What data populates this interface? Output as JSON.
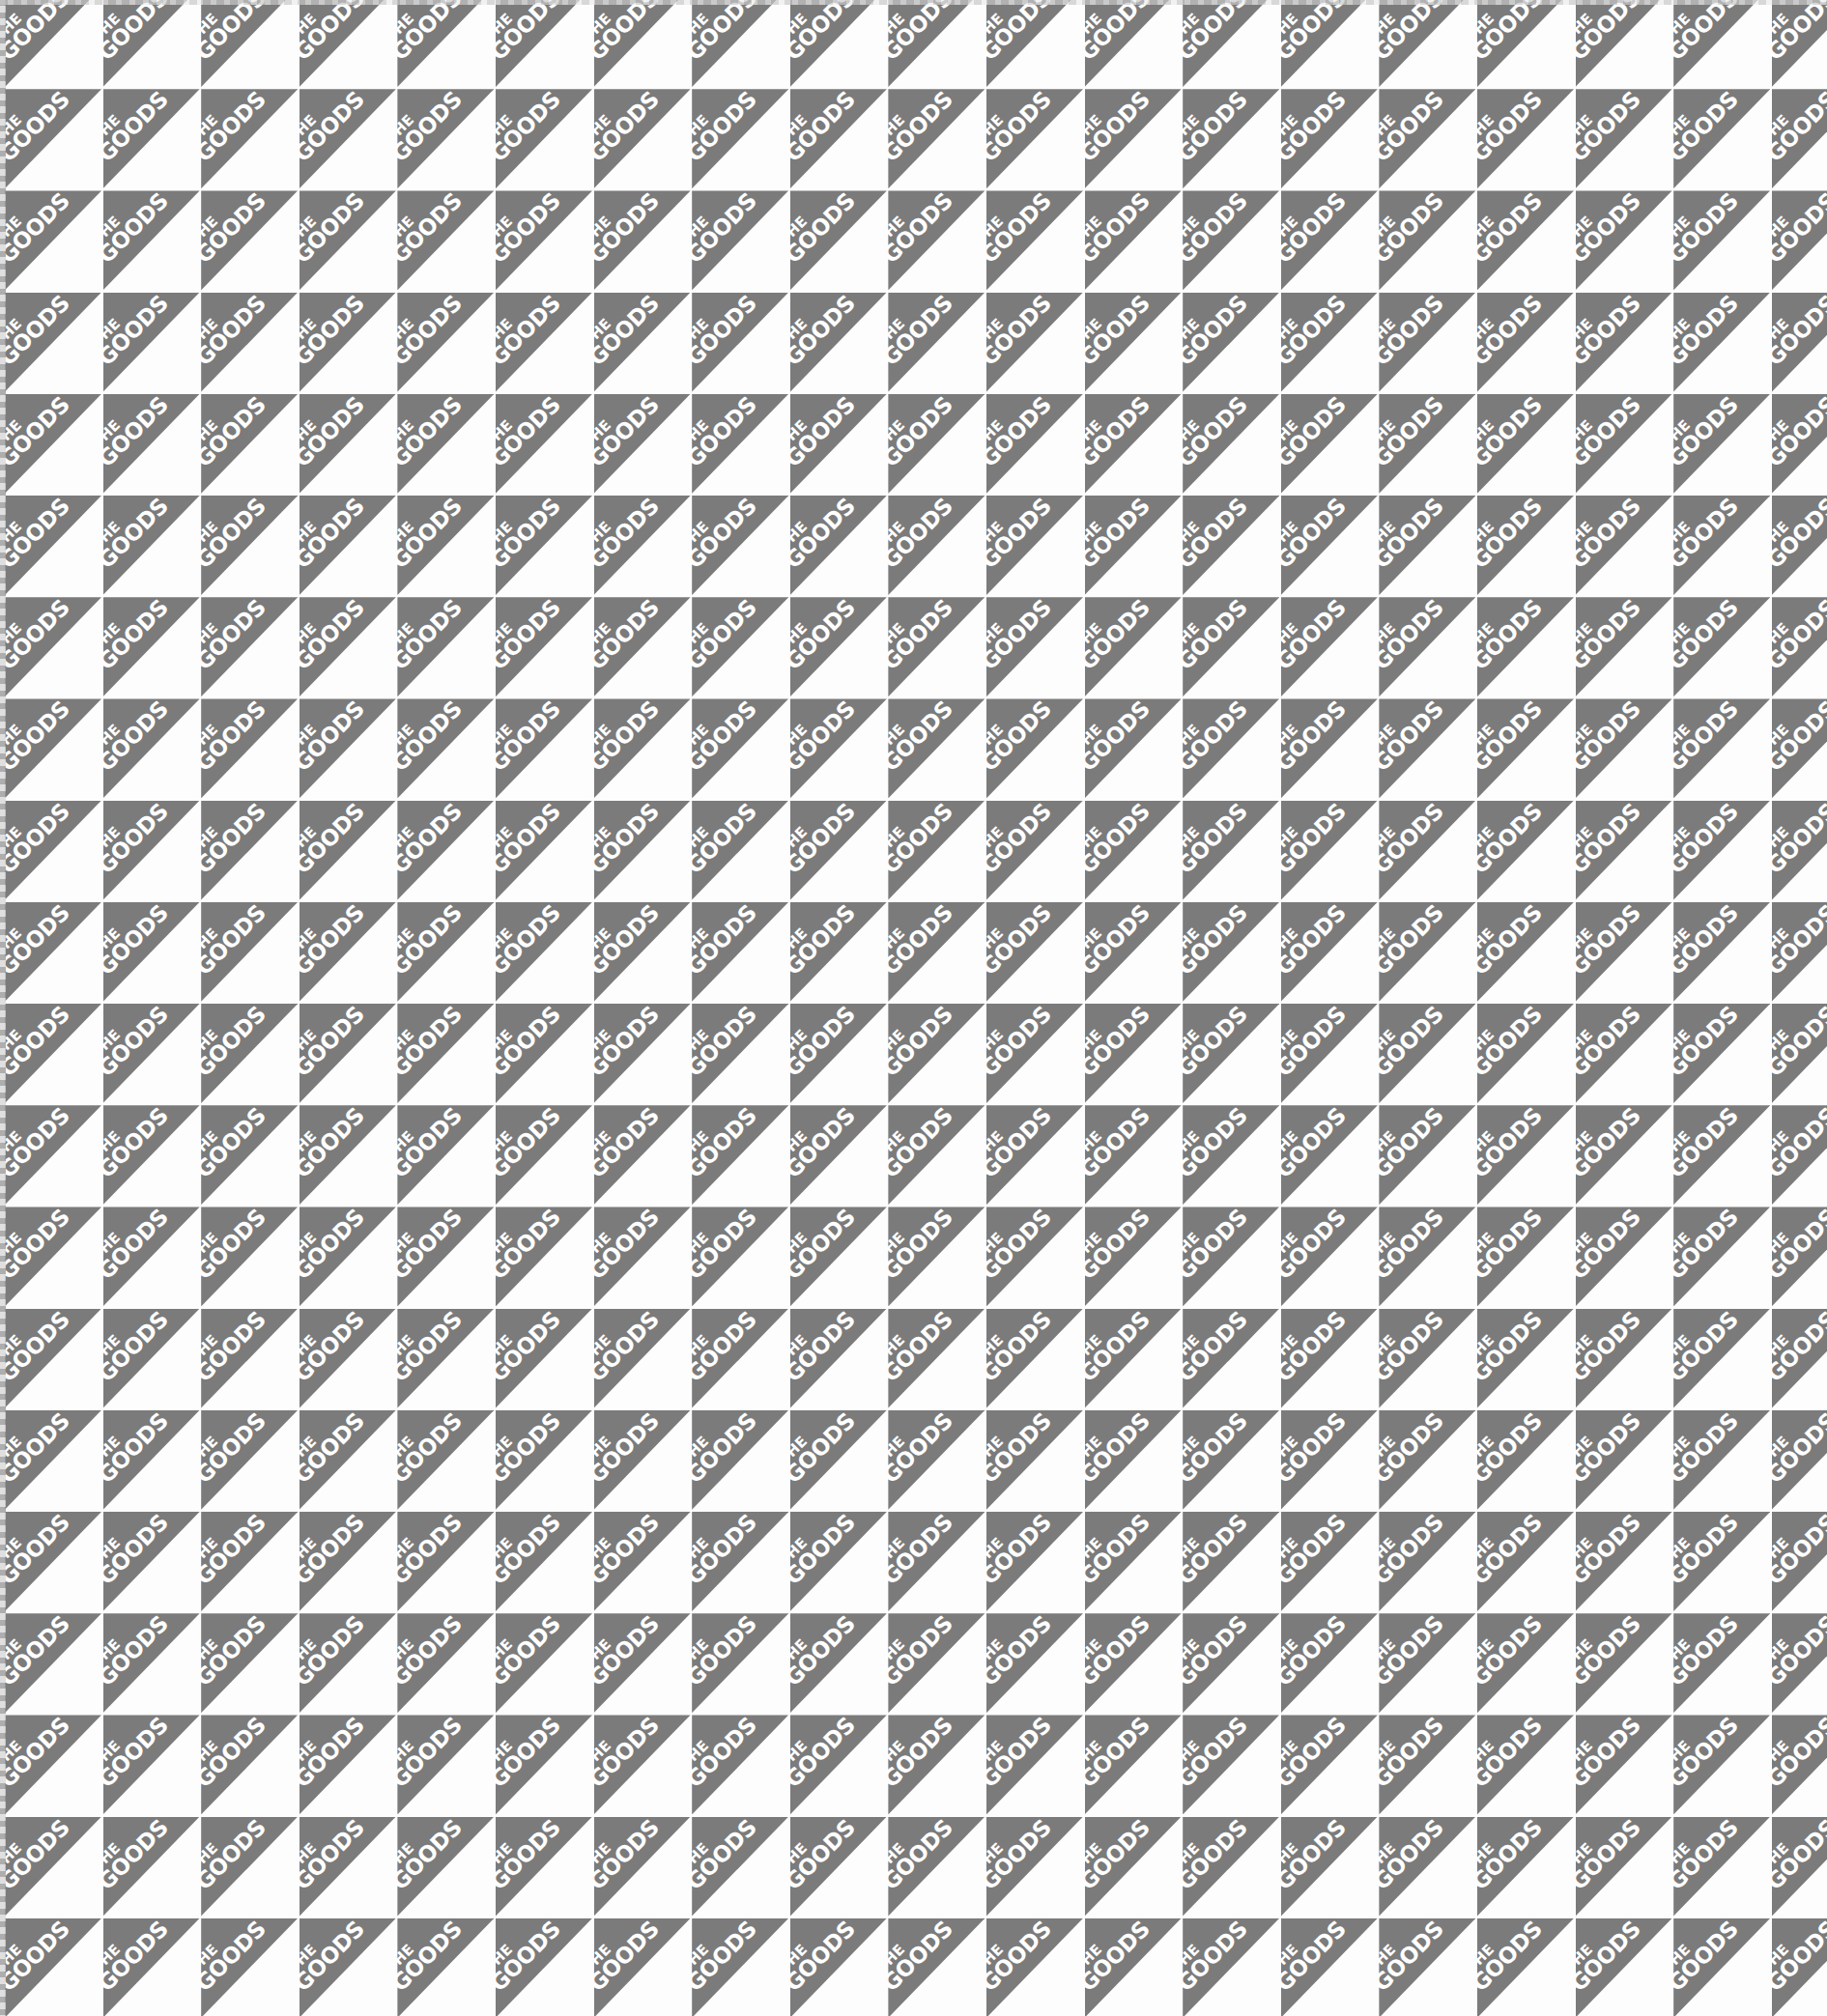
{
  "pattern": {
    "label_line1": "THE",
    "label_line2": "GOODS",
    "rows": 20,
    "cols": 19,
    "origin_x": 5,
    "origin_y": -13,
    "pitch_x": 101.6,
    "pitch_y": 105.2,
    "cell_w": 100,
    "cell_h": 103,
    "colors": {
      "triangle": "#7b7b7b",
      "background": "#fdfdfd",
      "text": "#ffffff"
    }
  }
}
